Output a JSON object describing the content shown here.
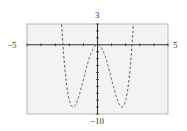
{
  "chart_data": {
    "type": "line",
    "title": "",
    "function": "y = x^4 - 6x^2",
    "xlabel": "",
    "ylabel": "",
    "xlim": [
      -5,
      5
    ],
    "ylim": [
      -10,
      3
    ],
    "xticks_step": 1,
    "yticks_step": 1,
    "grid": false,
    "line_style": "dashed",
    "labels": {
      "xmin": "−5",
      "xmax": "5",
      "ymax": "3",
      "ymin": "−10"
    },
    "series": [
      {
        "name": "f(x)",
        "x": [
          -2.6,
          -2.45,
          -2.2,
          -2.0,
          -1.732,
          -1.5,
          -1.0,
          -0.5,
          0,
          0.5,
          1.0,
          1.5,
          1.732,
          2.0,
          2.2,
          2.45,
          2.6
        ],
        "y": [
          5.1,
          0.0,
          -5.6,
          -8,
          -9,
          -8.4,
          -5,
          -1.44,
          0,
          -1.44,
          -5,
          -8.4,
          -9,
          -8,
          -5.6,
          0.0,
          5.1
        ]
      }
    ]
  },
  "colors": {
    "frame_bg": "#f3f3f3",
    "frame_border": "#b8b8b8",
    "axis": "#333333",
    "curve": "#555555"
  }
}
